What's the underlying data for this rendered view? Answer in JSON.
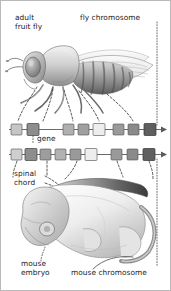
{
  "figure": {
    "background": "#ffffff",
    "border_color": "#b9b9b9"
  },
  "labels": {
    "adult_fruit_fly_line1": "adult",
    "adult_fruit_fly_line2": "fruit fly",
    "fly_chromosome": "fly chromosome",
    "gene": "gene",
    "spinal_chord_line1": "spinal",
    "spinal_chord_line2": "chord",
    "mouse_embryo_line1": "mouse",
    "mouse_embryo_line2": "embryo",
    "mouse_chromosome": "mouse chromosome"
  },
  "organisms": {
    "fly": {
      "name": "drosophila-fruit-fly-illustration",
      "body_fill": "#c9c9c9",
      "abdomen_stripe": "#6f6f6f",
      "eye_fill": "#9a9a9a",
      "wing_fill": "#e8e8e8"
    },
    "mouse_embryo": {
      "name": "mouse-embryo-illustration",
      "body_fill": "#efefef",
      "shade": "#b5b5b5",
      "neural_tube_fill": "#8e8e8e"
    }
  },
  "chromosomes": [
    {
      "name": "fly-chromosome",
      "axis_color": "#5a5a5a",
      "genes": [
        {
          "id": "lab",
          "fill": "#c6c6c6"
        },
        {
          "id": "pb",
          "fill": "#8d8d8d"
        },
        {
          "id": "Dfd",
          "fill": "#b0b0b0"
        },
        {
          "id": "Scr",
          "fill": "#a0a0a0"
        },
        {
          "id": "Antp",
          "fill": "#ededed"
        },
        {
          "id": "Ubx",
          "fill": "#9a9a9a"
        },
        {
          "id": "abdA",
          "fill": "#8a8a8a"
        },
        {
          "id": "abdB",
          "fill": "#5f5f5f"
        }
      ]
    },
    {
      "name": "mouse-chromosome",
      "axis_color": "#5a5a5a",
      "genes": [
        {
          "id": "Hoxb1",
          "fill": "#cfcfcf"
        },
        {
          "id": "Hoxb2",
          "fill": "#8d8d8d"
        },
        {
          "id": "Hoxb3",
          "fill": "#9d9d9d"
        },
        {
          "id": "Hoxb4",
          "fill": "#b2b2b2"
        },
        {
          "id": "Hoxb5",
          "fill": "#9a9a9a"
        },
        {
          "id": "Hoxb6",
          "fill": "#ededed"
        },
        {
          "id": "Hoxb7",
          "fill": "#9a9a9a"
        },
        {
          "id": "Hoxb8",
          "fill": "#8a8a8a"
        },
        {
          "id": "Hoxb9",
          "fill": "#5f5f5f"
        }
      ]
    }
  ],
  "connectors": {
    "fly_to_chromosome_count": 5,
    "right_dotted_guides": 2,
    "gene_callout": true,
    "spinal_chord_callout": true
  }
}
